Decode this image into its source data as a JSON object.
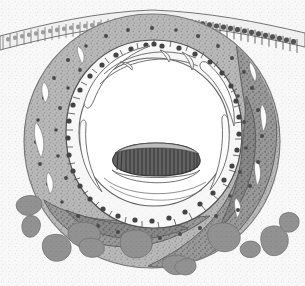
{
  "figure": {
    "title": "Histological cross-section of developing cochlear duct",
    "medium": "grayscale line-and-stipple drawing",
    "width_px": 305,
    "height_px": 286,
    "background_label": "stippled mesenchyme background",
    "visible_text": ""
  },
  "colors": {
    "page_background": "#ffffff",
    "stipple_background": "#f2f2f2",
    "stipple_dot": "#c9c9c9",
    "outer_mesenchyme_light": "#c2c2c2",
    "mesenchyme_mid": "#a8a8a8",
    "mesenchyme_dark": "#8d8d8d",
    "mesenchyme_darkest": "#7a7a7a",
    "cell_pale": "#f6f6f6",
    "cell_outline": "#4a4a4a",
    "nucleus": "#3a3a3a",
    "lumen": "#ffffff",
    "membrane_line": "#6b6b6b",
    "tectorial_body": "#555555",
    "tectorial_stripe": "#2e2e2e",
    "blob_fill": "#8a8a8a",
    "blob_outline": "#6e6e6e",
    "epithelium_cell": "#ededed",
    "epithelium_dark_cell": "#8f8f8f",
    "epithelium_line": "#5a5a5a"
  },
  "structures": [
    {
      "id": "surface-epithelium",
      "label": "Surface epithelium (columnar cell palisade)",
      "region": "top band, arcing from left edge to right edge"
    },
    {
      "id": "outer-mesenchyme",
      "label": "Outer condensed mesenchyme ring",
      "region": "broad gray annulus surrounding the duct"
    },
    {
      "id": "inner-mesenchyme-dark",
      "label": "Dark mesenchymal condensation",
      "region": "right and lower-right of the annulus"
    },
    {
      "id": "epithelial-lining",
      "label": "Pale epithelial cell lining with dark nuclei",
      "region": "inner ring directly bordering the lumen"
    },
    {
      "id": "lumen",
      "label": "Central lumen (cochlear duct cavity)",
      "region": "large white central oval"
    },
    {
      "id": "membrane-folds",
      "label": "Thin membranous folds (Reissner-type membrane)",
      "region": "arcs inside the lumen, upper and lateral"
    },
    {
      "id": "tectorial-body",
      "label": "Dark striated body (tectorial membrane / organ of Corti)",
      "region": "horizontal oval at lower-centre of lumen"
    },
    {
      "id": "perichondral-blobs",
      "label": "Detached mesenchymal / cartilage condensations",
      "region": "scattered below the duct"
    }
  ],
  "annotations": {
    "epithelium_cell_count": 46,
    "lining_cell_count": 34,
    "blob_count": 11,
    "tectorial_stripe_count": 22
  }
}
